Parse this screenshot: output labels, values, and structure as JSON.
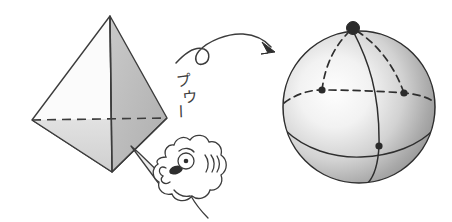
{
  "figure": {
    "background_color": "#ffffff",
    "ink_color": "#3c3c3c"
  },
  "sound_effect": {
    "text": "プウー",
    "characters": [
      "プ",
      "ウ",
      "ー"
    ],
    "romaji": "puu",
    "meaning": "blowing / puffing sound",
    "orientation": "vertical"
  },
  "tetrahedron": {
    "name": "tetrahedron",
    "vertices": {
      "apex": {
        "x": 110,
        "y": 16
      },
      "left": {
        "x": 32,
        "y": 120
      },
      "right": {
        "x": 167,
        "y": 118
      },
      "front": {
        "x": 112,
        "y": 172
      }
    },
    "face_fills": {
      "left_face": "#fbfbfb",
      "right_face": "#b9b9b9",
      "bottom_left_face": "#dcdcdc"
    },
    "hidden_edge_style": "dashed",
    "hidden_edge_label": "back edge left-right",
    "stroke_color": "#3c3c3c"
  },
  "blowpipe": {
    "name": "blowpipe",
    "from": {
      "x": 170,
      "y": 182
    },
    "to": {
      "x": 133,
      "y": 148
    },
    "fill": "#f2f2f2"
  },
  "face": {
    "name": "cartoon-face-blowing",
    "eye": {
      "x": 181,
      "y": 161
    },
    "cheek_lines": 4,
    "stroke_color": "#3c3c3c"
  },
  "arrow": {
    "name": "looping-transform-arrow",
    "has_loop": true,
    "start": {
      "x": 176,
      "y": 62
    },
    "end": {
      "x": 272,
      "y": 46
    },
    "stroke_color": "#3c3c3c"
  },
  "sphere": {
    "name": "sphere",
    "center": {
      "x": 359,
      "y": 107
    },
    "radius": 77,
    "bounds": {
      "left": 282,
      "right": 437,
      "top": 30,
      "bottom": 184
    },
    "highlight": {
      "x": 330,
      "y": 95,
      "color": "#fdfdfd"
    },
    "edge_shade": "#8d8d8d",
    "stroke_color": "#2e2e2e",
    "vertex_dots": [
      {
        "label": "top",
        "x": 353,
        "y": 28,
        "r": 6.5
      },
      {
        "label": "left",
        "x": 322,
        "y": 90,
        "r": 3.6
      },
      {
        "label": "right",
        "x": 404,
        "y": 93,
        "r": 3.6
      },
      {
        "label": "front-low",
        "x": 379,
        "y": 146,
        "r": 3.6
      }
    ],
    "arcs": {
      "solid": [
        "meridian through top and front-low vertex",
        "lower latitude band"
      ],
      "dashed": [
        "top to left vertex",
        "top to right vertex",
        "left vertex to right vertex (back)"
      ]
    }
  }
}
